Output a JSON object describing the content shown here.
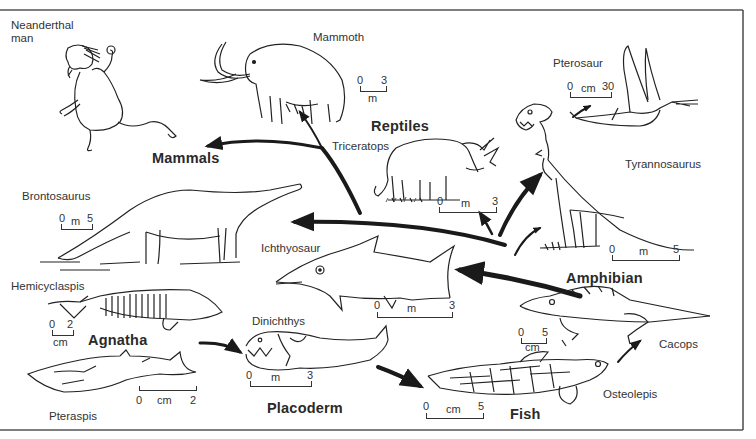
{
  "figure": {
    "type": "evolution-diagram",
    "groups": {
      "mammals": "Mammals",
      "reptiles": "Reptiles",
      "amphibian": "Amphibian",
      "agnatha": "Agnatha",
      "placoderm": "Placoderm",
      "fish": "Fish"
    },
    "animals": {
      "neanderthal": "Neanderthal\nman",
      "neanderthal_l1": "Neanderthal",
      "neanderthal_l2": "man",
      "mammoth": "Mammoth",
      "pterosaur": "Pterosaur",
      "triceratops": "Triceratops",
      "tyrannosaurus": "Tyrannosaurus",
      "brontosaurus": "Brontosaurus",
      "ichthyosaur": "Ichthyosaur",
      "hemicyclaspis": "Hemicyclaspis",
      "dinichthys": "Dinichthys",
      "pteraspis": "Pteraspis",
      "cacops": "Cacops",
      "osteolepis": "Osteolepis"
    },
    "scales": {
      "mammoth": {
        "start": "0",
        "end": "3",
        "unit": "m"
      },
      "pterosaur": {
        "start": "0",
        "end": "30",
        "unit": "cm"
      },
      "triceratops": {
        "start": "0",
        "end": "3",
        "unit": "m"
      },
      "tyrannosaurus": {
        "start": "0",
        "end": "5",
        "unit": "m"
      },
      "brontosaurus": {
        "start": "0",
        "end": "5",
        "unit": "m"
      },
      "ichthyosaur": {
        "start": "0",
        "end": "3",
        "unit": "m"
      },
      "hemicyclaspis": {
        "start": "0",
        "end": "2",
        "unit": "cm"
      },
      "dinichthys": {
        "start": "0",
        "end": "3",
        "unit": "m"
      },
      "pteraspis": {
        "start": "0",
        "end": "2",
        "unit": "cm"
      },
      "cacops": {
        "start": "0",
        "end": "5",
        "unit": "cm"
      },
      "osteolepis": {
        "start": "0",
        "end": "5",
        "unit": "cm"
      }
    },
    "colors": {
      "ink": "#1a1a1a",
      "paper": "#ffffff",
      "frame": "#555555"
    }
  }
}
